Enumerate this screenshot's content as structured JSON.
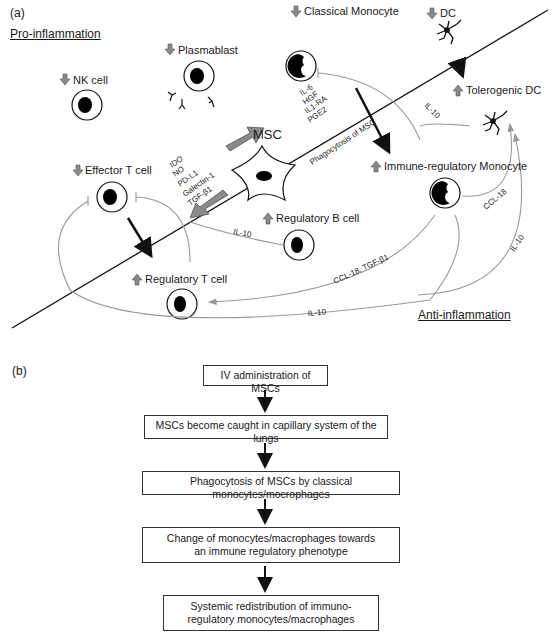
{
  "panel_a": {
    "label": "(a)",
    "pro_inflammation": "Pro-inflammation",
    "anti_inflammation": "Anti-inflammation",
    "cells": {
      "nk": {
        "name": "NK cell",
        "change": "down"
      },
      "plasmablast": {
        "name": "Plasmablast",
        "change": "down"
      },
      "classical_monocyte": {
        "name": "Classical Monocyte",
        "change": "down"
      },
      "dc": {
        "name": "DC",
        "change": "down"
      },
      "tolerogenic_dc": {
        "name": "Tolerogenic DC",
        "change": "up"
      },
      "msc": {
        "name": "MSC"
      },
      "immune_reg_monocyte": {
        "name": "Immune-regulatory Monocyte",
        "change": "up"
      },
      "effector_t": {
        "name": "Effector T cell",
        "change": "down"
      },
      "regulatory_b": {
        "name": "Regulatory B cell",
        "change": "up"
      },
      "regulatory_t": {
        "name": "Regulatory T cell",
        "change": "up"
      }
    },
    "msc_factors_to_monocyte": [
      "IL-6",
      "HGF",
      "IL1-RA",
      "PGE2"
    ],
    "msc_factors_to_tcell": [
      "IDO",
      "NO",
      "PD-L1",
      "Galectin-1",
      "TGF-β1"
    ],
    "phagocytosis_label": "Phagocytosis of MSC",
    "edges": {
      "il10_to_dc": "IL-10",
      "ccl18_to_dc": "CCL-18",
      "il10_mono_to_dc": "IL-10",
      "il10_bcell": "IL-10",
      "ccl18_tgf": "CCL-18, TGF-β1",
      "il10_bottom": "IL-10"
    }
  },
  "panel_b": {
    "label": "(b)",
    "steps": [
      "IV administration of MSCs",
      "MSCs become caught in capillary system of the lungs",
      "Phagocytosis of MSCs by classical monocytes/mocrophages",
      "Change of monocytes/macrophages towards an immune regulatory phenotype",
      "Systemic redistribution of immuno-regulatory monocytes/macrophages"
    ]
  },
  "colors": {
    "arrow_gray": "#8a8a8a",
    "line_gray": "#999999",
    "ink": "#111111"
  }
}
